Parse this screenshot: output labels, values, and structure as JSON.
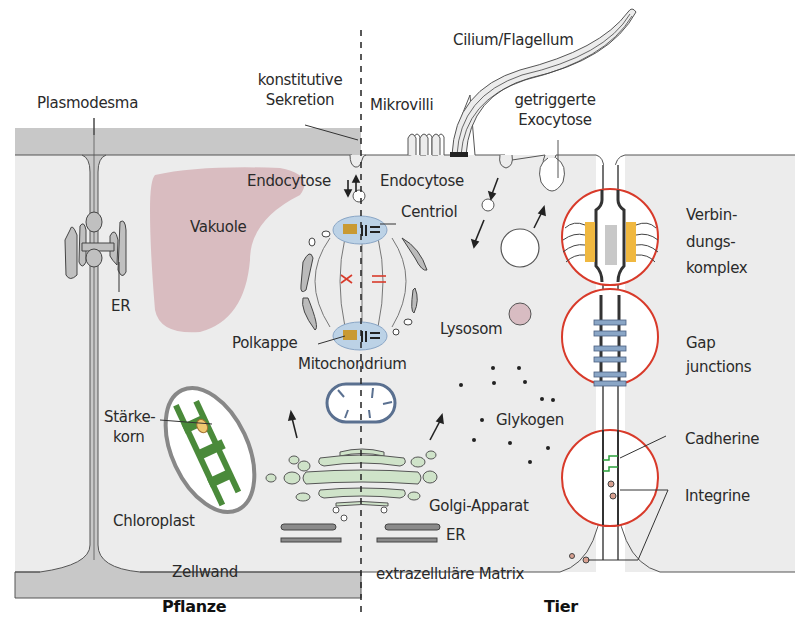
{
  "sides": {
    "left": "Pflanze",
    "right": "Tier"
  },
  "colors": {
    "cell_wall": "#c8c8c8",
    "cytoplasm": "#ececec",
    "vacuole": "#d9bcc0",
    "golgi": "#cfe3c9",
    "centrosome": "#bcd2e6",
    "polkappe": "#c99a33",
    "chloroplast_green": "#4a8a3a",
    "starch": "#f0c870",
    "junction_circle": "#d83a2a",
    "junction_yellow": "#f0b840",
    "gap_junction_blue": "#8aa6c6",
    "cadherin_green": "#2aa03a",
    "mitochondrion_outline": "#5a7090",
    "lysosome": "#d8bcc2"
  },
  "labels": {
    "plasmodesma": "Plasmodesma",
    "konstitutive_sekretion_1": "konstitutive",
    "konstitutive_sekretion_2": "Sekretion",
    "mikrovilli": "Mikrovilli",
    "cilium": "Cilium/Flagellum",
    "getriggerte_1": "getriggerte",
    "getriggerte_2": "Exocytose",
    "endocytose_left": "Endocytose",
    "endocytose_right": "Endocytose",
    "vakuole": "Vakuole",
    "er_left": "ER",
    "centriol": "Centriol",
    "polkappe": "Polkappe",
    "mitochondrium": "Mitochondrium",
    "lysosom": "Lysosom",
    "verbindungskomplex_1": "Verbin-",
    "verbindungskomplex_2": "dungs-",
    "verbindungskomplex_3": "komplex",
    "gap_1": "Gap",
    "gap_2": "junctions",
    "staerkekorn_1": "Stärke-",
    "staerkekorn_2": "korn",
    "chloroplast": "Chloroplast",
    "glykogen": "Glykogen",
    "cadherine": "Cadherine",
    "integrine": "Integrine",
    "golgi": "Golgi-Apparat",
    "er_right": "ER",
    "zellwand": "Zellwand",
    "ezm": "extrazelluläre Matrix"
  }
}
